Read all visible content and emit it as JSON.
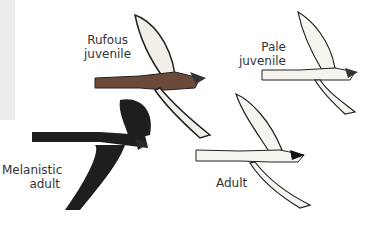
{
  "illustration": {
    "subject": "hawk plumage variations in flight",
    "labels": {
      "rufous_juvenile": [
        "Rufous",
        "juvenile"
      ],
      "pale_juvenile": [
        "Pale",
        "juvenile"
      ],
      "melanistic_adult": [
        "Melanistic",
        "adult"
      ],
      "adult": "Adult"
    },
    "colors": {
      "background": "#ffffff",
      "margin_strip": "#ececec",
      "melanistic": "#1e1e1e",
      "rufous_body": "#6b4a3a",
      "pale_wing": "#f4f1ea",
      "ink": "#222222"
    }
  }
}
